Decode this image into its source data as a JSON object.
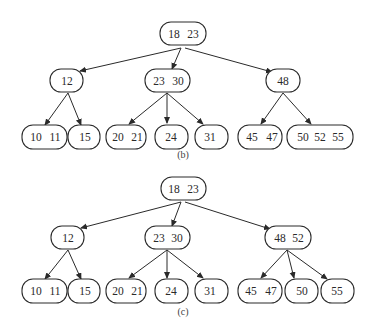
{
  "diagrams": [
    {
      "id": "b",
      "caption": "(b)",
      "caption_pos": [
        183,
        158
      ],
      "nodes": [
        {
          "id": "b-root",
          "keys": [
            "18",
            "23"
          ],
          "x": 160,
          "y": 22,
          "w": 46,
          "h": 23,
          "key_x": [
            174,
            193
          ]
        },
        {
          "id": "b-12",
          "keys": [
            "12"
          ],
          "x": 50,
          "y": 69,
          "w": 33,
          "h": 23,
          "key_x": [
            67
          ]
        },
        {
          "id": "b-23-30",
          "keys": [
            "23",
            "30"
          ],
          "x": 145,
          "y": 69,
          "w": 45,
          "h": 23,
          "key_x": [
            159,
            178
          ]
        },
        {
          "id": "b-48",
          "keys": [
            "48"
          ],
          "x": 266,
          "y": 69,
          "w": 34,
          "h": 23,
          "key_x": [
            283
          ]
        },
        {
          "id": "b-10-11",
          "keys": [
            "10",
            "11"
          ],
          "x": 22,
          "y": 125,
          "w": 45,
          "h": 24,
          "key_x": [
            36,
            55
          ]
        },
        {
          "id": "b-15",
          "keys": [
            "15"
          ],
          "x": 68,
          "y": 125,
          "w": 32,
          "h": 24,
          "key_x": [
            85
          ]
        },
        {
          "id": "b-20-21",
          "keys": [
            "20",
            "21"
          ],
          "x": 106,
          "y": 125,
          "w": 40,
          "h": 24,
          "key_x": [
            118,
            137
          ]
        },
        {
          "id": "b-24",
          "keys": [
            "24"
          ],
          "x": 155,
          "y": 125,
          "w": 33,
          "h": 24,
          "key_x": [
            171
          ]
        },
        {
          "id": "b-31",
          "keys": [
            "31"
          ],
          "x": 195,
          "y": 125,
          "w": 33,
          "h": 24,
          "key_x": [
            210
          ]
        },
        {
          "id": "b-45-47",
          "keys": [
            "45",
            "47"
          ],
          "x": 238,
          "y": 125,
          "w": 44,
          "h": 24,
          "key_x": [
            252,
            272
          ]
        },
        {
          "id": "b-50-52-55",
          "keys": [
            "50",
            "52",
            "55"
          ],
          "x": 287,
          "y": 125,
          "w": 66,
          "h": 24,
          "key_x": [
            303,
            320,
            338
          ]
        }
      ],
      "edges": [
        {
          "from": [
            181,
            48
          ],
          "to": [
            80,
            71
          ]
        },
        {
          "from": [
            181,
            48
          ],
          "to": [
            172,
            69
          ]
        },
        {
          "from": [
            185,
            48
          ],
          "to": [
            272,
            72
          ]
        },
        {
          "from": [
            68,
            93
          ],
          "to": [
            45,
            125
          ]
        },
        {
          "from": [
            68,
            93
          ],
          "to": [
            81,
            125
          ]
        },
        {
          "from": [
            167,
            93
          ],
          "to": [
            129,
            124
          ]
        },
        {
          "from": [
            167,
            93
          ],
          "to": [
            167,
            123
          ]
        },
        {
          "from": [
            167,
            93
          ],
          "to": [
            203,
            124
          ]
        },
        {
          "from": [
            283,
            93
          ],
          "to": [
            261,
            124
          ]
        },
        {
          "from": [
            283,
            93
          ],
          "to": [
            311,
            124
          ]
        }
      ]
    },
    {
      "id": "c",
      "caption": "(c)",
      "caption_pos": [
        183,
        315
      ],
      "nodes": [
        {
          "id": "c-root",
          "keys": [
            "18",
            "23"
          ],
          "x": 161,
          "y": 177,
          "w": 45,
          "h": 23,
          "key_x": [
            174,
            193
          ]
        },
        {
          "id": "c-12",
          "keys": [
            "12"
          ],
          "x": 51,
          "y": 226,
          "w": 33,
          "h": 23,
          "key_x": [
            68
          ]
        },
        {
          "id": "c-23-30",
          "keys": [
            "23",
            "30"
          ],
          "x": 145,
          "y": 226,
          "w": 45,
          "h": 23,
          "key_x": [
            159,
            177
          ]
        },
        {
          "id": "c-48-52",
          "keys": [
            "48",
            "52"
          ],
          "x": 265,
          "y": 226,
          "w": 46,
          "h": 23,
          "key_x": [
            280,
            298
          ]
        },
        {
          "id": "c-10-11",
          "keys": [
            "10",
            "11"
          ],
          "x": 22,
          "y": 279,
          "w": 45,
          "h": 24,
          "key_x": [
            36,
            55
          ]
        },
        {
          "id": "c-15",
          "keys": [
            "15"
          ],
          "x": 68,
          "y": 279,
          "w": 32,
          "h": 24,
          "key_x": [
            85
          ]
        },
        {
          "id": "c-20-21",
          "keys": [
            "20",
            "21"
          ],
          "x": 106,
          "y": 279,
          "w": 40,
          "h": 24,
          "key_x": [
            118,
            137
          ]
        },
        {
          "id": "c-24",
          "keys": [
            "24"
          ],
          "x": 155,
          "y": 279,
          "w": 33,
          "h": 24,
          "key_x": [
            171
          ]
        },
        {
          "id": "c-31",
          "keys": [
            "31"
          ],
          "x": 195,
          "y": 279,
          "w": 33,
          "h": 24,
          "key_x": [
            210
          ]
        },
        {
          "id": "c-45-47",
          "keys": [
            "45",
            "47"
          ],
          "x": 238,
          "y": 279,
          "w": 44,
          "h": 24,
          "key_x": [
            251,
            271
          ]
        },
        {
          "id": "c-50",
          "keys": [
            "50"
          ],
          "x": 285,
          "y": 279,
          "w": 33,
          "h": 24,
          "key_x": [
            302
          ]
        },
        {
          "id": "c-55",
          "keys": [
            "55"
          ],
          "x": 321,
          "y": 279,
          "w": 33,
          "h": 24,
          "key_x": [
            337
          ]
        }
      ],
      "edges": [
        {
          "from": [
            181,
            202
          ],
          "to": [
            81,
            228
          ]
        },
        {
          "from": [
            181,
            202
          ],
          "to": [
            172,
            226
          ]
        },
        {
          "from": [
            185,
            202
          ],
          "to": [
            270,
            229
          ]
        },
        {
          "from": [
            68,
            250
          ],
          "to": [
            45,
            279
          ]
        },
        {
          "from": [
            68,
            250
          ],
          "to": [
            81,
            279
          ]
        },
        {
          "from": [
            167,
            250
          ],
          "to": [
            129,
            278
          ]
        },
        {
          "from": [
            167,
            250
          ],
          "to": [
            167,
            278
          ]
        },
        {
          "from": [
            167,
            250
          ],
          "to": [
            203,
            278
          ]
        },
        {
          "from": [
            287,
            250
          ],
          "to": [
            261,
            278
          ]
        },
        {
          "from": [
            287,
            250
          ],
          "to": [
            294,
            278
          ]
        },
        {
          "from": [
            287,
            250
          ],
          "to": [
            327,
            279
          ]
        }
      ]
    }
  ]
}
